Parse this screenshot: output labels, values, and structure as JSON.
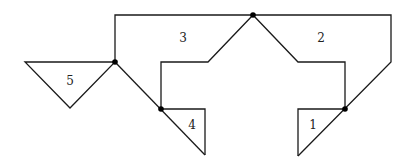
{
  "diagram": {
    "labels": [
      {
        "id": "1",
        "text": "1",
        "x": 313,
        "y": 129
      },
      {
        "id": "2",
        "text": "2",
        "x": 321,
        "y": 42
      },
      {
        "id": "3",
        "text": "3",
        "x": 183,
        "y": 42
      },
      {
        "id": "4",
        "text": "4",
        "x": 192,
        "y": 129
      },
      {
        "id": "5",
        "text": "5",
        "x": 70,
        "y": 85
      }
    ],
    "vertices": [
      {
        "name": "top-vertex",
        "x": 253,
        "y": 15
      },
      {
        "name": "left-vertex",
        "x": 115,
        "y": 62
      },
      {
        "name": "middle-left-vertex",
        "x": 161,
        "y": 109
      },
      {
        "name": "right-vertex",
        "x": 345,
        "y": 109
      }
    ],
    "colors": {
      "line": "#1a1a1a",
      "dot": "#000000",
      "background": "#ffffff"
    }
  }
}
